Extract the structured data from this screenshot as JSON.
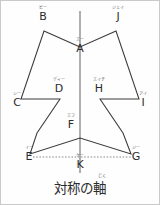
{
  "figure": {
    "title_caption": "対称の軸",
    "caption_ruby": "じく",
    "axis_color": "#7a7a7a",
    "shape_color": "#3a3a3a",
    "dotted_color": "#8a8a8a",
    "background": "#fefefe",
    "border_color": "#c9c9c9"
  },
  "vertices": [
    {
      "id": "A",
      "base": "A",
      "ruby": "エー",
      "x": 79,
      "y": 43
    },
    {
      "id": "B",
      "base": "B",
      "ruby": "ビー",
      "x": 42,
      "y": 28
    },
    {
      "id": "C",
      "base": "C",
      "ruby": "シー",
      "x": 16,
      "y": 101
    },
    {
      "id": "D",
      "base": "D",
      "ruby": "ディー",
      "x": 58,
      "y": 95
    },
    {
      "id": "E",
      "base": "E",
      "ruby": "イー",
      "x": 28,
      "y": 155
    },
    {
      "id": "F",
      "base": "F",
      "ruby": "エフ",
      "x": 70,
      "y": 130
    },
    {
      "id": "G",
      "base": "G",
      "ruby": "ジー",
      "x": 133,
      "y": 155
    },
    {
      "id": "H",
      "base": "H",
      "ruby": "エイチ",
      "x": 98,
      "y": 95
    },
    {
      "id": "I",
      "base": "I",
      "ruby": "アイ",
      "x": 142,
      "y": 101
    },
    {
      "id": "J",
      "base": "J",
      "ruby": "ジェイ",
      "x": 117,
      "y": 28
    },
    {
      "id": "K",
      "base": "K",
      "ruby": "ケー",
      "x": 79,
      "y": 163
    }
  ],
  "geometry": {
    "axis_of_symmetry": {
      "x": 79,
      "y1": 10,
      "y2": 172
    },
    "dotted_segment": {
      "x1": 32,
      "y1": 156,
      "x2": 130,
      "y2": 156
    },
    "polygon_points": "79,46 43,30 20,98 59,98 36,132 79,132 36,132 29,153 79,137 130,153 122,132 79,132 122,132 99,98 138,98 115,30",
    "outline_path": "M 79,46 L 43,30 L 20,98 L 59,98 L 36,132 L 29,153 L 79,137 L 130,153 L 122,132 L 99,98 L 138,98 L 115,30 Z"
  },
  "labels": {
    "axis_label": "対称の軸"
  }
}
